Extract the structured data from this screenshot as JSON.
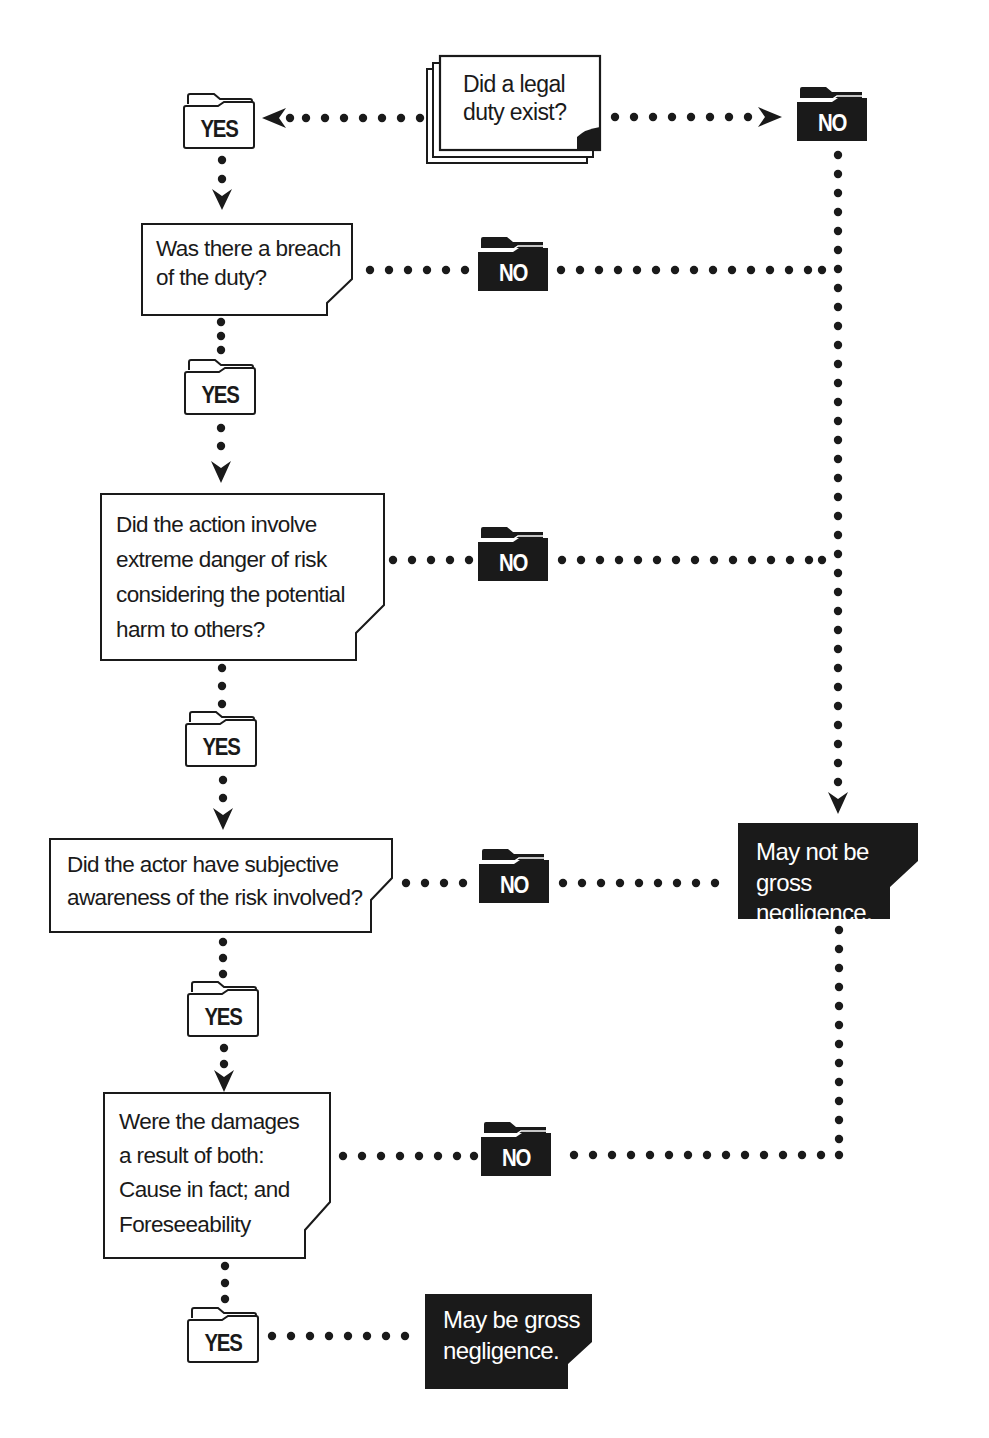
{
  "flowchart": {
    "start": {
      "question": "Did a legal\nduty exist?"
    },
    "questions": [
      {
        "id": "breach",
        "text": "Was there a breach\nof the duty?"
      },
      {
        "id": "extreme-danger",
        "text": "Did the action involve\nextreme danger of risk\nconsidering the potential\nharm to others?"
      },
      {
        "id": "subjective-awareness",
        "text": "Did the actor have subjective\nawareness of the risk involved?"
      },
      {
        "id": "damages",
        "text": "Were the damages\na result of both:\nCause in fact; and\nForeseeability"
      }
    ],
    "labels": {
      "yes": "YES",
      "no": "NO"
    },
    "outcomes": {
      "negative": "May not be gross\nnegligence.",
      "positive": "May be gross\nnegligence."
    },
    "colors": {
      "ink": "#1a1a1a",
      "background": "#ffffff",
      "outcome_fill": "#1a1a1a",
      "outcome_text": "#ffffff"
    }
  }
}
